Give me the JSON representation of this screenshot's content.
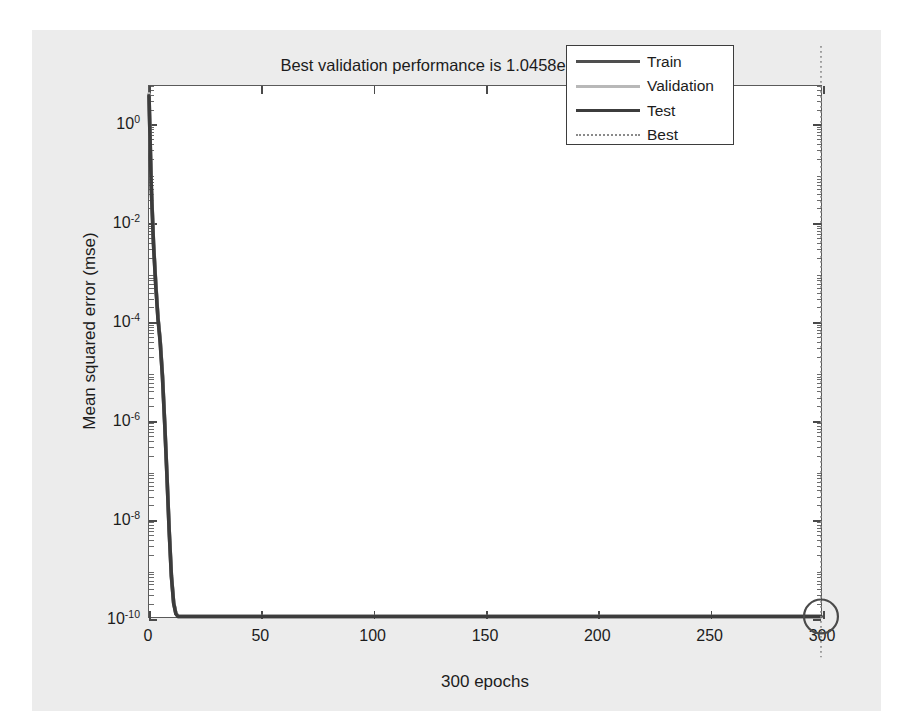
{
  "title": "Best validation performance is 1.0458e-10 at epoch 300",
  "xlabel": "300 epochs",
  "ylabel": "Mean squared error (mse)",
  "legend": {
    "items": [
      {
        "label": "Train",
        "color": "#4f4f4f",
        "style": "solid",
        "width": 3
      },
      {
        "label": "Validation",
        "color": "#b8b8b8",
        "style": "solid",
        "width": 3
      },
      {
        "label": "Test",
        "color": "#3c3c3c",
        "style": "solid",
        "width": 3
      },
      {
        "label": "Best",
        "color": "#8a8a8a",
        "style": "dotted",
        "width": 2
      }
    ]
  },
  "axes": {
    "x_ticks": [
      "0",
      "50",
      "100",
      "150",
      "200",
      "250",
      "300"
    ],
    "y_ticks": [
      "10",
      "10",
      "10",
      "10",
      "10",
      "10"
    ],
    "y_exponents": [
      "0",
      "-2",
      "-4",
      "-6",
      "-8",
      "-10"
    ]
  },
  "best_marker": {
    "epoch": 300,
    "value": "1.0458e-10"
  },
  "chart_data": {
    "type": "line",
    "title": "Best validation performance is 1.0458e-10 at epoch 300",
    "xlabel": "300 epochs",
    "ylabel": "Mean squared error (mse)",
    "yscale": "log",
    "xlim": [
      0,
      300
    ],
    "ylim": [
      1e-10,
      6.0
    ],
    "grid": false,
    "legend_position": "top-right",
    "x_ticks": [
      0,
      50,
      100,
      150,
      200,
      250,
      300
    ],
    "y_ticks": [
      1.0,
      0.01,
      0.0001,
      1e-06,
      1e-08,
      1e-10
    ],
    "annotations": [
      {
        "type": "best-line",
        "x": 300,
        "style": "dotted",
        "label": "Best"
      },
      {
        "type": "best-marker",
        "x": 300,
        "y": 1.0458e-10,
        "shape": "circle"
      }
    ],
    "x": [
      0,
      1,
      2,
      3,
      4,
      5,
      6,
      7,
      8,
      9,
      10,
      11,
      12,
      13,
      14,
      20,
      40,
      60,
      100,
      150,
      200,
      250,
      300
    ],
    "series": [
      {
        "name": "Train",
        "color": "#4f4f4f",
        "values": [
          4.0,
          0.06,
          0.004,
          0.0006,
          0.00012,
          4e-05,
          8e-06,
          9e-07,
          8e-08,
          6e-09,
          7e-10,
          2e-10,
          1.2e-10,
          1.05e-10,
          1.046e-10,
          1.046e-10,
          1.046e-10,
          1.046e-10,
          1.046e-10,
          1.046e-10,
          1.046e-10,
          1.046e-10,
          1.0458e-10
        ]
      },
      {
        "name": "Validation",
        "color": "#b8b8b8",
        "values": [
          4.2,
          0.07,
          0.0045,
          0.00065,
          0.00013,
          4.2e-05,
          8.3e-06,
          9.3e-07,
          8.3e-08,
          6.3e-09,
          7.3e-10,
          2.1e-10,
          1.22e-10,
          1.06e-10,
          1.047e-10,
          1.047e-10,
          1.047e-10,
          1.047e-10,
          1.047e-10,
          1.047e-10,
          1.047e-10,
          1.047e-10,
          1.0458e-10
        ]
      },
      {
        "name": "Test",
        "color": "#3c3c3c",
        "values": [
          3.8,
          0.055,
          0.0038,
          0.00055,
          0.000115,
          3.8e-05,
          7.7e-06,
          8.7e-07,
          7.7e-08,
          5.8e-09,
          6.8e-10,
          1.95e-10,
          1.18e-10,
          1.04e-10,
          1.045e-10,
          1.045e-10,
          1.045e-10,
          1.045e-10,
          1.045e-10,
          1.045e-10,
          1.045e-10,
          1.045e-10,
          1.0458e-10
        ]
      }
    ]
  }
}
